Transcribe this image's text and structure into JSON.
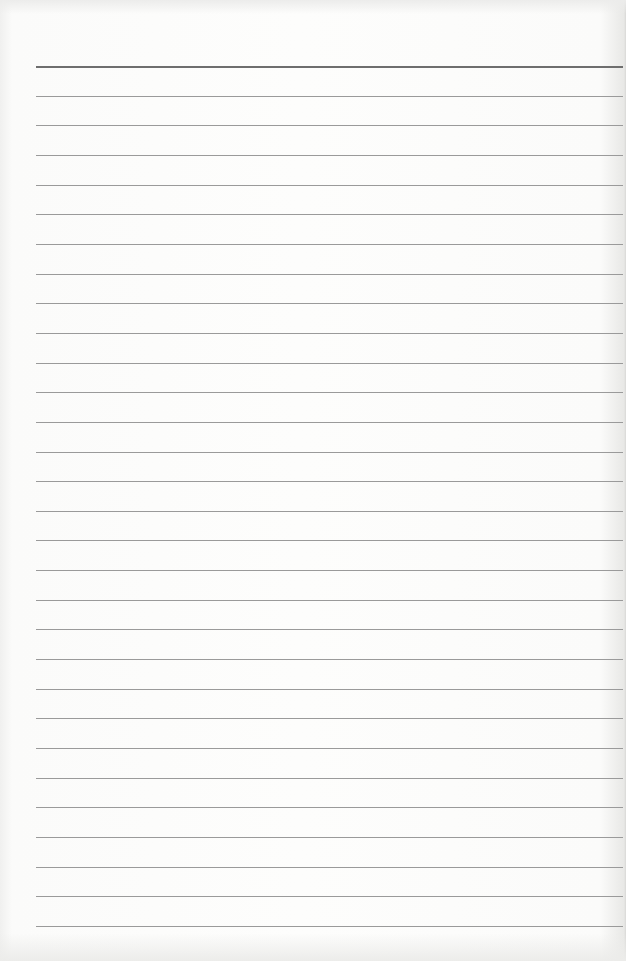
{
  "document": {
    "type": "ruled-notebook-page",
    "ruled_line_count": 30,
    "header_line": true,
    "colors": {
      "paper": "#fdfdfc",
      "rule": "#9a9a9a",
      "header_rule": "#6e6e6e"
    },
    "text_content": ""
  }
}
